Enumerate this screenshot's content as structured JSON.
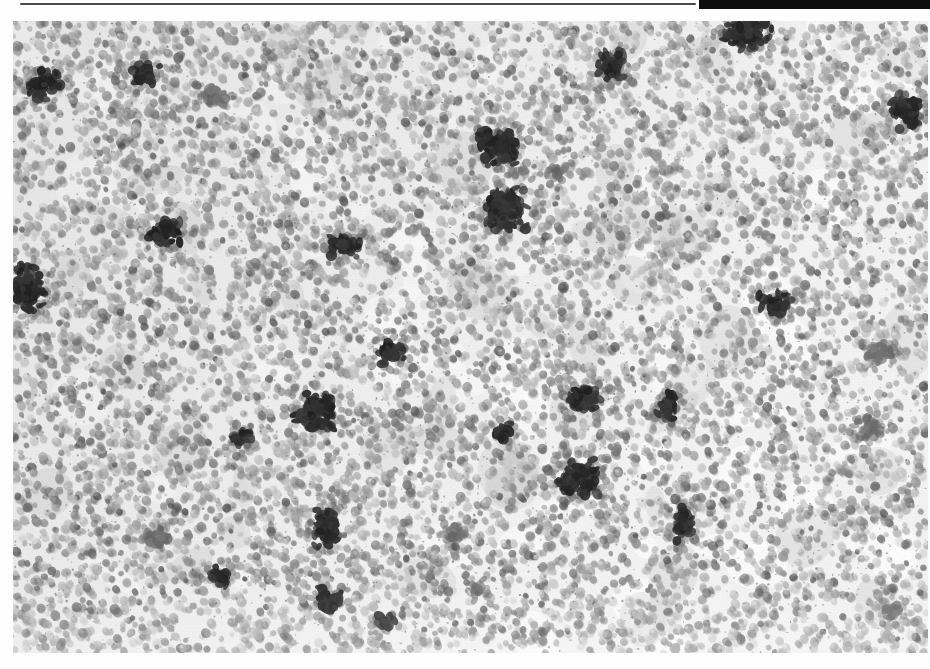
{
  "page": {
    "width": 930,
    "height": 669,
    "background": "#fefefe"
  },
  "header": {
    "thin_rule": {
      "x": 20,
      "y": 3,
      "width": 676,
      "height": 2.4,
      "color": "#4b4b4b"
    },
    "thick_rule": {
      "x": 699,
      "y": 0,
      "width": 231,
      "height": 9,
      "color": "#0e0e0e"
    }
  },
  "photo": {
    "description": "Black-and-white halftone photograph of a dense layer of small round eggs or granules covering a surface, with scattered irregular dark clumps",
    "x": 13,
    "y": 21,
    "width": 915,
    "height": 632,
    "seed": 7,
    "palette": {
      "base": "#efefef",
      "paper_white": "#fcfcfc",
      "granule_light": "#c4c4c4",
      "granule_mid": "#9a9a9a",
      "granule_dark": "#6e6e6e",
      "cluster_dark": "#2c2c2c",
      "cluster_faint": "#6a6a6a"
    },
    "granules": {
      "count": 9000,
      "min_radius": 2.6,
      "max_radius": 5.2
    },
    "clusters": [
      {
        "x": 45,
        "y": 85,
        "w": 38,
        "h": 30,
        "dark": true
      },
      {
        "x": 145,
        "y": 74,
        "w": 30,
        "h": 26,
        "dark": true
      },
      {
        "x": 213,
        "y": 96,
        "w": 26,
        "h": 20,
        "dark": false
      },
      {
        "x": 612,
        "y": 64,
        "w": 30,
        "h": 34,
        "dark": true
      },
      {
        "x": 747,
        "y": 34,
        "w": 52,
        "h": 32,
        "dark": true
      },
      {
        "x": 908,
        "y": 112,
        "w": 34,
        "h": 36,
        "dark": true
      },
      {
        "x": 500,
        "y": 147,
        "w": 48,
        "h": 40,
        "dark": true
      },
      {
        "x": 555,
        "y": 170,
        "w": 22,
        "h": 16,
        "dark": false
      },
      {
        "x": 505,
        "y": 208,
        "w": 44,
        "h": 50,
        "dark": true
      },
      {
        "x": 165,
        "y": 232,
        "w": 40,
        "h": 26,
        "dark": true
      },
      {
        "x": 345,
        "y": 247,
        "w": 34,
        "h": 26,
        "dark": true
      },
      {
        "x": 26,
        "y": 287,
        "w": 36,
        "h": 52,
        "dark": true
      },
      {
        "x": 775,
        "y": 303,
        "w": 36,
        "h": 24,
        "dark": true
      },
      {
        "x": 390,
        "y": 350,
        "w": 30,
        "h": 30,
        "dark": true
      },
      {
        "x": 880,
        "y": 352,
        "w": 30,
        "h": 26,
        "dark": false
      },
      {
        "x": 315,
        "y": 410,
        "w": 44,
        "h": 44,
        "dark": true
      },
      {
        "x": 240,
        "y": 437,
        "w": 24,
        "h": 20,
        "dark": true
      },
      {
        "x": 585,
        "y": 398,
        "w": 34,
        "h": 30,
        "dark": true
      },
      {
        "x": 668,
        "y": 407,
        "w": 24,
        "h": 30,
        "dark": true
      },
      {
        "x": 500,
        "y": 432,
        "w": 22,
        "h": 18,
        "dark": true
      },
      {
        "x": 868,
        "y": 428,
        "w": 30,
        "h": 24,
        "dark": false
      },
      {
        "x": 580,
        "y": 478,
        "w": 50,
        "h": 38,
        "dark": true
      },
      {
        "x": 683,
        "y": 524,
        "w": 20,
        "h": 40,
        "dark": true
      },
      {
        "x": 326,
        "y": 530,
        "w": 26,
        "h": 46,
        "dark": true
      },
      {
        "x": 160,
        "y": 537,
        "w": 30,
        "h": 20,
        "dark": false
      },
      {
        "x": 455,
        "y": 533,
        "w": 22,
        "h": 16,
        "dark": false
      },
      {
        "x": 221,
        "y": 576,
        "w": 28,
        "h": 22,
        "dark": true
      },
      {
        "x": 330,
        "y": 600,
        "w": 32,
        "h": 28,
        "dark": true
      },
      {
        "x": 385,
        "y": 622,
        "w": 20,
        "h": 16,
        "dark": true
      },
      {
        "x": 478,
        "y": 589,
        "w": 20,
        "h": 16,
        "dark": false
      },
      {
        "x": 893,
        "y": 611,
        "w": 26,
        "h": 14,
        "dark": false
      }
    ]
  }
}
